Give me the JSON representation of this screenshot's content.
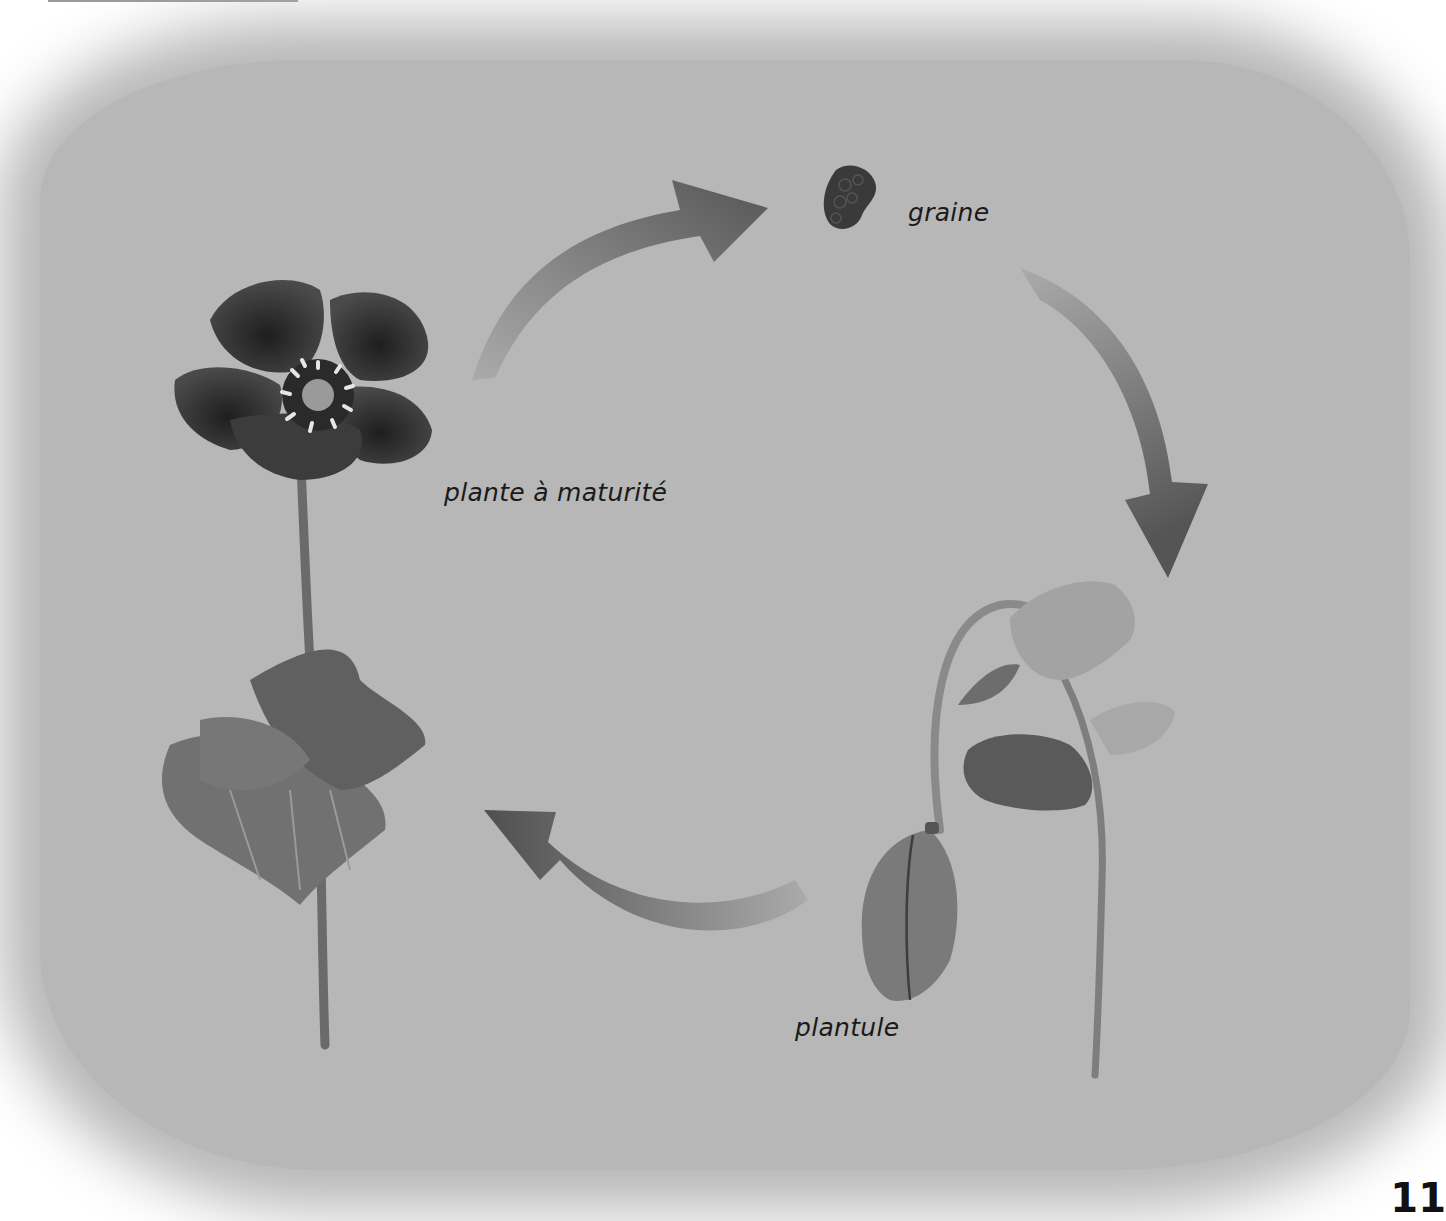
{
  "diagram": {
    "type": "life-cycle",
    "stages": [
      {
        "id": "seed",
        "label": "graine"
      },
      {
        "id": "seedling",
        "label": "plantule"
      },
      {
        "id": "mature",
        "label": "plante à maturité"
      }
    ],
    "arrows": [
      {
        "from": "mature",
        "to": "seed"
      },
      {
        "from": "seed",
        "to": "seedling"
      },
      {
        "from": "seedling",
        "to": "mature"
      }
    ],
    "colors": {
      "background": "#b7b7b7",
      "arrow_dark": "#5a5a5a",
      "arrow_light": "#a8a8a8",
      "petal": "#2e2e2e",
      "leaf": "#6b6b6b",
      "text": "#1a1a1a"
    }
  },
  "page": {
    "number": "11"
  }
}
